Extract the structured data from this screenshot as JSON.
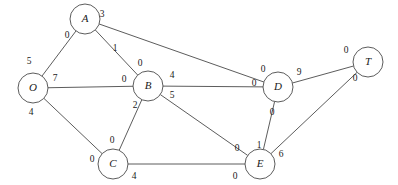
{
  "figure": {
    "title": "",
    "background_color": "#ffffff",
    "line_color": "#4a4a4a",
    "text_color": "#1a1a1a",
    "width": 398,
    "height": 185
  },
  "chart_data": {
    "type": "diagram",
    "diagram_kind": "undirected-network-flow-graph",
    "title": "",
    "xlabel": "",
    "ylabel": "",
    "grid": false,
    "legend": false,
    "nodes": [
      {
        "id": "O",
        "label": "O",
        "x": 33,
        "y": 88,
        "r": 15
      },
      {
        "id": "A",
        "label": "A",
        "x": 85,
        "y": 19,
        "r": 15
      },
      {
        "id": "B",
        "label": "B",
        "x": 148,
        "y": 86,
        "r": 15
      },
      {
        "id": "C",
        "label": "C",
        "x": 113,
        "y": 164,
        "r": 15
      },
      {
        "id": "D",
        "label": "D",
        "x": 278,
        "y": 87,
        "r": 15
      },
      {
        "id": "E",
        "label": "E",
        "x": 260,
        "y": 164,
        "r": 15
      },
      {
        "id": "T",
        "label": "T",
        "x": 368,
        "y": 62,
        "r": 15
      }
    ],
    "edges": [
      {
        "id": "O-A",
        "from": "O",
        "to": "A",
        "from_label": "5",
        "to_label": "0",
        "from_label_x": 29,
        "from_label_y": 62,
        "to_label_x": 67,
        "to_label_y": 36
      },
      {
        "id": "O-B",
        "from": "O",
        "to": "B",
        "from_label": "7",
        "to_label": "0",
        "from_label_x": 55,
        "from_label_y": 79,
        "to_label_x": 124,
        "to_label_y": 80
      },
      {
        "id": "O-C",
        "from": "O",
        "to": "C",
        "from_label": "4",
        "to_label": "0",
        "from_label_x": 31,
        "from_label_y": 113,
        "to_label_x": 92,
        "to_label_y": 160
      },
      {
        "id": "A-B",
        "from": "A",
        "to": "B",
        "from_label": "1",
        "to_label": "0",
        "from_label_x": 115,
        "from_label_y": 49,
        "to_label_x": 140,
        "to_label_y": 64
      },
      {
        "id": "A-D",
        "from": "A",
        "to": "D",
        "from_label": "3",
        "to_label": "0",
        "from_label_x": 102,
        "from_label_y": 15,
        "to_label_x": 263,
        "to_label_y": 70
      },
      {
        "id": "B-D",
        "from": "B",
        "to": "D",
        "from_label": "4",
        "to_label": "0",
        "from_label_x": 172,
        "from_label_y": 76,
        "to_label_x": 254,
        "to_label_y": 84
      },
      {
        "id": "B-C",
        "from": "B",
        "to": "C",
        "from_label": "2",
        "to_label": "0",
        "from_label_x": 135,
        "from_label_y": 106,
        "to_label_x": 112,
        "to_label_y": 141
      },
      {
        "id": "B-E",
        "from": "B",
        "to": "E",
        "from_label": "5",
        "to_label": "0",
        "from_label_x": 172,
        "from_label_y": 96,
        "to_label_x": 237,
        "to_label_y": 149
      },
      {
        "id": "C-E",
        "from": "C",
        "to": "E",
        "from_label": "4",
        "to_label": "0",
        "from_label_x": 134,
        "from_label_y": 177,
        "to_label_x": 235,
        "to_label_y": 177
      },
      {
        "id": "D-E",
        "from": "D",
        "to": "E",
        "from_label": "0",
        "to_label": "1",
        "from_label_x": 272,
        "from_label_y": 113,
        "to_label_x": 259,
        "to_label_y": 146
      },
      {
        "id": "D-T",
        "from": "D",
        "to": "T",
        "from_label": "9",
        "to_label": "0",
        "from_label_x": 299,
        "from_label_y": 73,
        "to_label_x": 346,
        "to_label_y": 51
      },
      {
        "id": "E-T",
        "from": "E",
        "to": "T",
        "from_label": "6",
        "to_label": "0",
        "from_label_x": 281,
        "from_label_y": 155,
        "to_label_x": 355,
        "to_label_y": 79
      }
    ]
  }
}
